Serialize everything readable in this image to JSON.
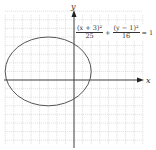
{
  "chart_data": {
    "type": "line",
    "title": "",
    "equation": "(x + 3)^2/25 + (y - 1)^2/16 = 1",
    "equation_parts": {
      "term1_num": "(x + 3)²",
      "term1_den": "25",
      "plus": "+",
      "term2_num": "(y − 1)²",
      "term2_den": "16",
      "equals": "= 1"
    },
    "curve": "ellipse",
    "center": [
      -3,
      1
    ],
    "semi_axis_x": 5,
    "semi_axis_y": 4,
    "xlabel": "x",
    "ylabel": "y",
    "xlim": [
      -8,
      8
    ],
    "ylim": [
      -8,
      8
    ],
    "grid": true,
    "grid_step": 1
  },
  "axes": {
    "x_label": "x",
    "y_label": "y"
  }
}
